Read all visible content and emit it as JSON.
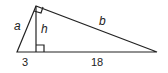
{
  "diagram": {
    "type": "right-triangle-altitude",
    "labels": {
      "leg_short": "a",
      "leg_long": "b",
      "altitude": "h",
      "segment_left": "3",
      "segment_right": "18"
    },
    "colors": {
      "stroke": "#222222",
      "background": "#ffffff"
    }
  }
}
